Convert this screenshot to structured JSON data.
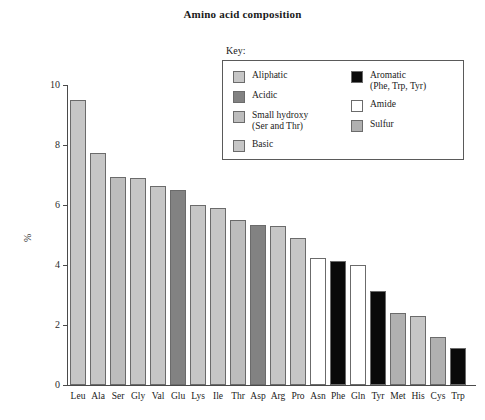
{
  "chart_data": {
    "type": "bar",
    "title": "Amino acid composition",
    "xlabel": "",
    "ylabel": "%",
    "ylim": [
      0,
      10
    ],
    "yticks": [
      0,
      2,
      4,
      6,
      8,
      10
    ],
    "grid": false,
    "legend_position": "upper-center-right",
    "categories": [
      "Leu",
      "Ala",
      "Ser",
      "Gly",
      "Val",
      "Glu",
      "Lys",
      "Ile",
      "Thr",
      "Asp",
      "Arg",
      "Pro",
      "Asn",
      "Phe",
      "Gln",
      "Tyr",
      "Met",
      "His",
      "Cys",
      "Trp"
    ],
    "values": [
      9.5,
      7.75,
      6.95,
      6.9,
      6.65,
      6.5,
      6.0,
      5.9,
      5.5,
      5.35,
      5.3,
      4.9,
      4.25,
      4.15,
      4.0,
      3.15,
      2.4,
      2.3,
      1.6,
      1.25
    ],
    "bar_groups": [
      "Aliphatic",
      "Aliphatic",
      "Small hydroxy",
      "Aliphatic",
      "Aliphatic",
      "Acidic",
      "Basic",
      "Aliphatic",
      "Small hydroxy",
      "Acidic",
      "Basic",
      "Aliphatic",
      "Amide",
      "Aromatic",
      "Amide",
      "Aromatic",
      "Sulfur",
      "Basic",
      "Sulfur",
      "Aromatic"
    ]
  },
  "legend": {
    "key_label": "Key:",
    "left_column": [
      {
        "label": "Aliphatic",
        "color": "#c6c6c6"
      },
      {
        "label": "Acidic",
        "color": "#828282"
      },
      {
        "label": "Small hydroxy\n(Ser and Thr)",
        "color": "#bdbdbd"
      },
      {
        "label": "Basic",
        "color": "#c6c6c6"
      }
    ],
    "right_column": [
      {
        "label": "Aromatic\n(Phe, Trp, Tyr)",
        "color": "#0a0a0a"
      },
      {
        "label": "Amide",
        "color": "#ffffff"
      },
      {
        "label": "Sulfur",
        "color": "#b0b0b0"
      }
    ]
  },
  "colors": {
    "Aliphatic": "#c6c6c6",
    "Acidic": "#828282",
    "Small hydroxy": "#bdbdbd",
    "Basic": "#c6c6c6",
    "Aromatic": "#0a0a0a",
    "Amide": "#ffffff",
    "Sulfur": "#b0b0b0",
    "axis": "#4a4a4a",
    "bar_outline": "#6b6b6b"
  }
}
